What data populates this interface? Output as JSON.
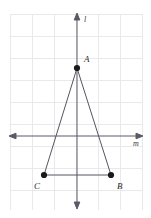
{
  "figure": {
    "background_color": "#ffffff",
    "grid": {
      "color": "#e9e9ec",
      "spacing": 22,
      "left": 10,
      "top": 14,
      "right": 142,
      "bottom": 210,
      "visible": true
    },
    "lines": [
      {
        "name": "l",
        "label": "l",
        "orientation": "vertical",
        "x": 77,
        "y_start": 15,
        "y_end": 207,
        "arrows": "both",
        "color": "#5a5a66",
        "label_x": 84,
        "label_y": 22
      },
      {
        "name": "m",
        "label": "m",
        "orientation": "horizontal",
        "y": 136,
        "x_start": 11,
        "x_end": 141,
        "arrows": "both",
        "color": "#5a5a66",
        "label_x": 133,
        "label_y": 146
      }
    ],
    "points": [
      {
        "label": "A",
        "x": 77,
        "y": 68,
        "label_x": 84,
        "label_y": 62,
        "dot_radius": 3.1,
        "color": "#1a1a1a"
      },
      {
        "label": "B",
        "x": 111,
        "y": 175,
        "label_x": 117,
        "label_y": 189,
        "dot_radius": 3.1,
        "color": "#1a1a1a"
      },
      {
        "label": "C",
        "x": 44,
        "y": 175,
        "label_x": 34,
        "label_y": 189,
        "dot_radius": 3.1,
        "color": "#1a1a1a"
      }
    ],
    "triangle": {
      "name": "triangle-ABC",
      "vertices": "A,B,C",
      "path": "M 77 68 L 111 175 L 44 175 Z",
      "stroke_color": "#55555f"
    }
  }
}
